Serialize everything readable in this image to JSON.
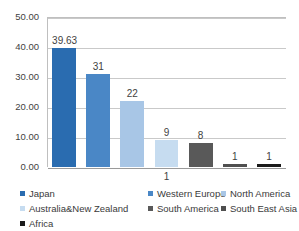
{
  "chart_data": {
    "type": "bar",
    "title": "",
    "xlabel": "",
    "ylabel": "",
    "ylim": [
      0,
      50
    ],
    "grid": true,
    "legend_position": "bottom",
    "categories": [
      "Japan",
      "Western Europe",
      "North America",
      "Australia&New Zealand",
      "South America",
      "South East Asia",
      "Africa"
    ],
    "values": [
      39.63,
      31,
      22,
      9,
      8,
      1,
      1
    ],
    "data_labels": [
      "39.63",
      "31",
      "22",
      "9",
      "8",
      "1",
      "1"
    ],
    "extra_labels": [
      {
        "text": "1",
        "position": "below-axis",
        "category_index": 3
      }
    ],
    "y_ticks": [
      "50.00",
      "40.00",
      "30.00",
      "20.00",
      "10.00",
      "0.00"
    ],
    "y_tick_values": [
      50,
      40,
      30,
      20,
      10,
      0
    ],
    "colors": [
      "#2a6cb0",
      "#4a87c6",
      "#a8c6e6",
      "#c6dcf0",
      "#595959",
      "#4f4f4f",
      "#1a1a1a"
    ],
    "grid_color": "#c9c9c9",
    "axis_color": "#9a9a9a",
    "background_color": "#ffffff"
  },
  "legend": {
    "rows": [
      [
        {
          "label": "Japan",
          "color": "#2a6cb0",
          "left": 0
        },
        {
          "label": "Western Europe",
          "color": "#4a87c6",
          "left": 128
        },
        {
          "label": "North America",
          "color": "#a8c6e6",
          "left": 201
        }
      ],
      [
        {
          "label": "Australia&New Zealand",
          "color": "#c6dcf0",
          "left": 0
        },
        {
          "label": "South America",
          "color": "#595959",
          "left": 128
        },
        {
          "label": "South East Asia",
          "color": "#4f4f4f",
          "left": 201
        }
      ],
      [
        {
          "label": "Africa",
          "color": "#1a1a1a",
          "left": 0
        }
      ]
    ]
  }
}
